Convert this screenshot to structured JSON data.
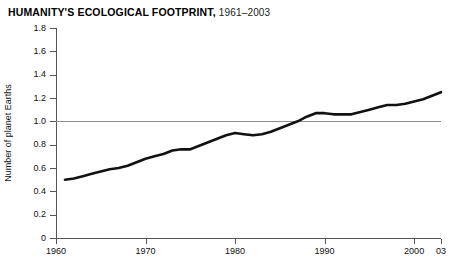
{
  "title": {
    "main": "HUMANITY'S ECOLOGICAL FOOTPRINT,",
    "range": "1961–2003"
  },
  "axes": {
    "y_title": "Number of planet Earths",
    "y_ticks": [
      "0",
      "0.2",
      "0.4",
      "0.6",
      "0.8",
      "1.0",
      "1.2",
      "1.4",
      "1.6",
      "1.8"
    ],
    "x_ticks": [
      "1960",
      "1970",
      "1980",
      "1990",
      "2000",
      "03"
    ]
  },
  "chart_data": {
    "type": "line",
    "title": "HUMANITY'S ECOLOGICAL FOOTPRINT, 1961–2003",
    "xlabel": "",
    "ylabel": "Number of planet Earths",
    "xlim": [
      1961,
      2003
    ],
    "ylim": [
      0,
      1.8
    ],
    "ytick_step": 0.2,
    "xtick_values": [
      1960,
      1970,
      1980,
      1990,
      2000,
      2003
    ],
    "xtick_labels": [
      "1960",
      "1970",
      "1980",
      "1990",
      "2000",
      "03"
    ],
    "grid": false,
    "legend": "none",
    "line_color": "#111111",
    "reference_line": {
      "value": 1.0,
      "color": "#8d8d8d",
      "label": ""
    },
    "series": [
      {
        "name": "Humanity's ecological footprint",
        "x": [
          1961,
          1962,
          1963,
          1964,
          1965,
          1966,
          1967,
          1968,
          1969,
          1970,
          1971,
          1972,
          1973,
          1974,
          1975,
          1976,
          1977,
          1978,
          1979,
          1980,
          1981,
          1982,
          1983,
          1984,
          1985,
          1986,
          1987,
          1988,
          1989,
          1990,
          1991,
          1992,
          1993,
          1994,
          1995,
          1996,
          1997,
          1998,
          1999,
          2000,
          2001,
          2002,
          2003
        ],
        "values": [
          0.5,
          0.51,
          0.53,
          0.55,
          0.57,
          0.59,
          0.6,
          0.62,
          0.65,
          0.68,
          0.7,
          0.72,
          0.75,
          0.76,
          0.76,
          0.79,
          0.82,
          0.85,
          0.88,
          0.9,
          0.89,
          0.88,
          0.89,
          0.91,
          0.94,
          0.97,
          1.0,
          1.04,
          1.07,
          1.07,
          1.06,
          1.06,
          1.06,
          1.08,
          1.1,
          1.12,
          1.14,
          1.14,
          1.15,
          1.17,
          1.19,
          1.22,
          1.25
        ]
      }
    ]
  }
}
